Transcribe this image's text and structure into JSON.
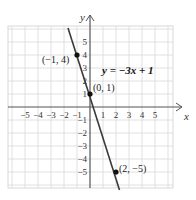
{
  "chart_data": {
    "type": "line",
    "title": "",
    "equation": "y = −3x + 1",
    "xlabel": "x",
    "ylabel": "y",
    "xlim": [
      -6,
      6
    ],
    "ylim": [
      -6,
      6
    ],
    "grid": true,
    "x_ticks": [
      -5,
      -4,
      -3,
      -2,
      -1,
      1,
      2,
      3,
      4,
      5
    ],
    "y_ticks": [
      -5,
      -4,
      -3,
      -2,
      -1,
      1,
      2,
      3,
      4,
      5
    ],
    "x_tick_labels": [
      "−5",
      "−4",
      "−3",
      "−2",
      "−1",
      "1",
      "2",
      "3",
      "4",
      "5"
    ],
    "y_tick_labels": [
      "−5",
      "−4",
      "−3",
      "−2",
      "−1",
      "1",
      "2",
      "3",
      "4",
      "5"
    ],
    "series": [
      {
        "name": "y = −3x + 1",
        "slope": -3,
        "intercept": 1,
        "x": [
          -1.4,
          2.25
        ],
        "y": [
          5.2,
          -5.75
        ]
      }
    ],
    "points": [
      {
        "x": -1,
        "y": 4,
        "label": "(−1, 4)"
      },
      {
        "x": 0,
        "y": 1,
        "label": "(0, 1)"
      },
      {
        "x": 2,
        "y": -5,
        "label": "(2, −5)"
      }
    ],
    "colors": {
      "line": "#3a3a3a",
      "grid": "#d8d8d8",
      "axis": "#555555",
      "point": "#111111"
    }
  },
  "labels": {
    "equation": "y = −3x + 1",
    "x_axis": "x",
    "y_axis": "y",
    "p1": "(−1, 4)",
    "p2": "(0, 1)",
    "p3": "(2, −5)"
  }
}
